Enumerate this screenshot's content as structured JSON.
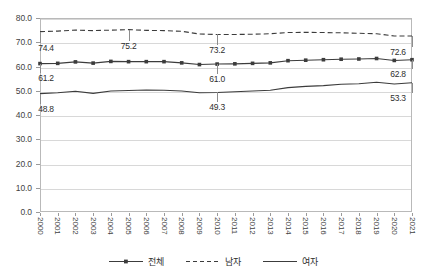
{
  "chart_data": {
    "type": "line",
    "title": "",
    "xlabel": "",
    "ylabel": "",
    "ylim": [
      0.0,
      80.0
    ],
    "ytick_labels": [
      "0.0",
      "10.0",
      "20.0",
      "30.0",
      "40.0",
      "50.0",
      "60.0",
      "70.0",
      "80.0"
    ],
    "ytick_values": [
      0,
      10,
      20,
      30,
      40,
      50,
      60,
      70,
      80
    ],
    "grid": true,
    "legend_position": "bottom-center",
    "categories": [
      "2000",
      "2001",
      "2002",
      "2003",
      "2004",
      "2005",
      "2006",
      "2007",
      "2008",
      "2009",
      "2010",
      "2011",
      "2012",
      "2013",
      "2014",
      "2015",
      "2016",
      "2017",
      "2018",
      "2019",
      "2020",
      "2021"
    ],
    "series": [
      {
        "name": "전체",
        "style": "solid-markers",
        "color": "#3c3c3c",
        "values": [
          61.2,
          61.3,
          61.9,
          61.4,
          62.1,
          62.0,
          62.0,
          62.0,
          61.5,
          60.8,
          61.0,
          61.1,
          61.3,
          61.5,
          62.4,
          62.6,
          62.8,
          63.0,
          63.1,
          63.3,
          62.5,
          62.8
        ]
      },
      {
        "name": "남자",
        "style": "dashed",
        "color": "#3c3c3c",
        "values": [
          74.4,
          74.6,
          75.0,
          74.8,
          75.0,
          75.2,
          74.9,
          74.8,
          74.5,
          73.4,
          73.2,
          73.2,
          73.3,
          73.5,
          74.0,
          74.1,
          74.0,
          73.9,
          73.7,
          73.5,
          72.6,
          72.6
        ]
      },
      {
        "name": "여자",
        "style": "solid",
        "color": "#3c3c3c",
        "values": [
          48.8,
          49.2,
          49.8,
          48.9,
          49.9,
          50.1,
          50.3,
          50.2,
          49.9,
          49.2,
          49.3,
          49.6,
          49.9,
          50.2,
          51.3,
          51.8,
          52.1,
          52.7,
          52.9,
          53.5,
          52.8,
          53.3
        ]
      }
    ],
    "point_labels": [
      {
        "series": "남자",
        "category": "2000",
        "value": 74.4,
        "text": "74.4"
      },
      {
        "series": "남자",
        "category": "2005",
        "value": 75.2,
        "text": "75.2"
      },
      {
        "series": "남자",
        "category": "2010",
        "value": 73.2,
        "text": "73.2"
      },
      {
        "series": "남자",
        "category": "2021",
        "value": 72.6,
        "text": "72.6"
      },
      {
        "series": "전체",
        "category": "2000",
        "value": 61.2,
        "text": "61.2"
      },
      {
        "series": "전체",
        "category": "2010",
        "value": 61.0,
        "text": "61.0"
      },
      {
        "series": "전체",
        "category": "2021",
        "value": 62.8,
        "text": "62.8"
      },
      {
        "series": "여자",
        "category": "2000",
        "value": 48.8,
        "text": "48.8"
      },
      {
        "series": "여자",
        "category": "2010",
        "value": 49.3,
        "text": "49.3"
      },
      {
        "series": "여자",
        "category": "2021",
        "value": 53.3,
        "text": "53.3"
      }
    ]
  },
  "legend": {
    "items": [
      {
        "label": "전체"
      },
      {
        "label": "남자"
      },
      {
        "label": "여자"
      }
    ]
  }
}
